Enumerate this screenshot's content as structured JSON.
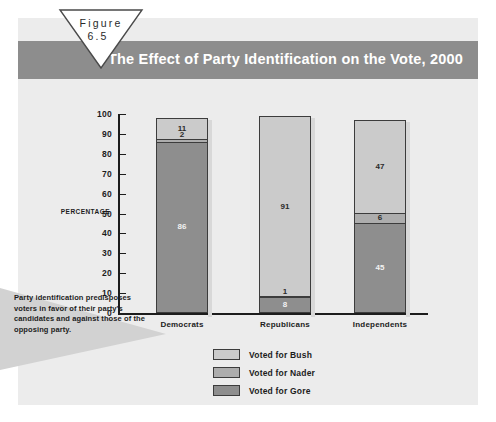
{
  "figure": {
    "label": "Figure",
    "number": "6.5"
  },
  "header": {
    "title": "The Effect of Party Identification on the Vote, 2000"
  },
  "caption": {
    "text": "Party identification predisposes voters in favor of their party's candidates and against those of the opposing party."
  },
  "colors": {
    "title_bar": "#8d8d8d",
    "panel_background": "#ececec",
    "bush": "#cbcbcb",
    "nader": "#adadad",
    "gore": "#8e8e8e",
    "axis": "#1c1c1c"
  },
  "chart_data": {
    "type": "bar",
    "title": "The Effect of Party Identification on the Vote, 2000",
    "xlabel": "",
    "ylabel": "PERCENTAGE",
    "ylim": [
      0,
      100
    ],
    "yticks": [
      0,
      10,
      20,
      30,
      40,
      50,
      60,
      70,
      80,
      90,
      100
    ],
    "ytick_labels": [
      "0",
      "10",
      "20",
      "30",
      "40",
      "50",
      "60",
      "70",
      "80",
      "90",
      "100"
    ],
    "grid": false,
    "stacked": true,
    "legend_position": "bottom-center",
    "categories": [
      "Democrats",
      "Republicans",
      "Independents"
    ],
    "series": [
      {
        "name": "Voted for Bush",
        "color": "#cbcbcb",
        "values": [
          11,
          91,
          47
        ]
      },
      {
        "name": "Voted for Nader",
        "color": "#adadad",
        "values": [
          2,
          1,
          6
        ]
      },
      {
        "name": "Voted for Gore",
        "color": "#8e8e8e",
        "values": [
          86,
          8,
          45
        ]
      }
    ],
    "stack_order_bottom_to_top": [
      "Voted for Gore",
      "Voted for Nader",
      "Voted for Bush"
    ],
    "totals": [
      99,
      100,
      98
    ]
  }
}
